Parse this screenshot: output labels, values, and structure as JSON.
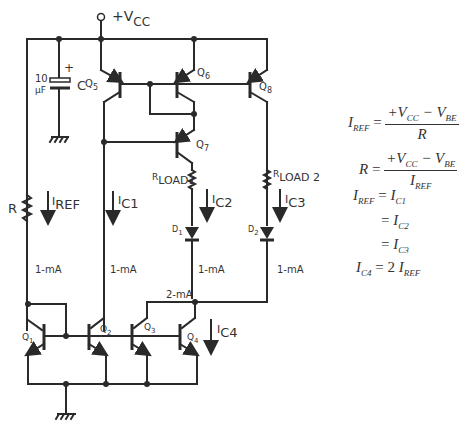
{
  "diagram": {
    "supply": {
      "label": "+V",
      "sub": "CC"
    },
    "capacitor": {
      "value_top": "10",
      "value_bottom": "µF",
      "polarity": "+",
      "name": "C"
    },
    "resistor": {
      "name": "R"
    },
    "transistors": [
      {
        "id": "Q1",
        "label": "Q",
        "sub": "1"
      },
      {
        "id": "Q2",
        "label": "Q",
        "sub": "2"
      },
      {
        "id": "Q3",
        "label": "Q",
        "sub": "3"
      },
      {
        "id": "Q4",
        "label": "Q",
        "sub": "4"
      },
      {
        "id": "Q5",
        "label": "Q",
        "sub": "5"
      },
      {
        "id": "Q6",
        "label": "Q",
        "sub": "6"
      },
      {
        "id": "Q7",
        "label": "Q",
        "sub": "7"
      },
      {
        "id": "Q8",
        "label": "Q",
        "sub": "8"
      }
    ],
    "loads": [
      {
        "label": "R",
        "sub": "LOAD1"
      },
      {
        "label": "R",
        "sub": "LOAD 2"
      }
    ],
    "diodes": [
      {
        "label": "D",
        "sub": "1"
      },
      {
        "label": "D",
        "sub": "2"
      }
    ],
    "currents": [
      {
        "label": "I",
        "sub": "REF"
      },
      {
        "label": "I",
        "sub": "C1"
      },
      {
        "label": "I",
        "sub": "C2"
      },
      {
        "label": "I",
        "sub": "C3"
      },
      {
        "label": "I",
        "sub": "C4"
      }
    ],
    "values": {
      "ref": "1-mA",
      "c1": "1-mA",
      "c2": "1-mA",
      "c3": "1-mA",
      "node": "2-mA"
    }
  },
  "equations": {
    "eq1": {
      "lhs": "I",
      "lhs_sub": "REF",
      "eq": "=",
      "num": "+V",
      "num_sub1": "CC",
      "minus": " − V",
      "num_sub2": "BE",
      "den": "R"
    },
    "eq2": {
      "lhs": "R",
      "eq": "=",
      "num": "+V",
      "num_sub1": "CC",
      "minus": " − V",
      "num_sub2": "BE",
      "den": "I",
      "den_sub": "REF"
    },
    "eq3": {
      "lhs": "I",
      "lhs_sub": "REF",
      "eq": "=",
      "rhs": "I",
      "rhs_sub": "C1"
    },
    "eq4": {
      "eq": "=",
      "rhs": "I",
      "rhs_sub": "C2"
    },
    "eq5": {
      "eq": "=",
      "rhs": "I",
      "rhs_sub": "C3"
    },
    "eq6": {
      "lhs": "I",
      "lhs_sub": "C4",
      "eq": "=",
      "coef": "2",
      "rhs": "I",
      "rhs_sub": "REF"
    }
  }
}
